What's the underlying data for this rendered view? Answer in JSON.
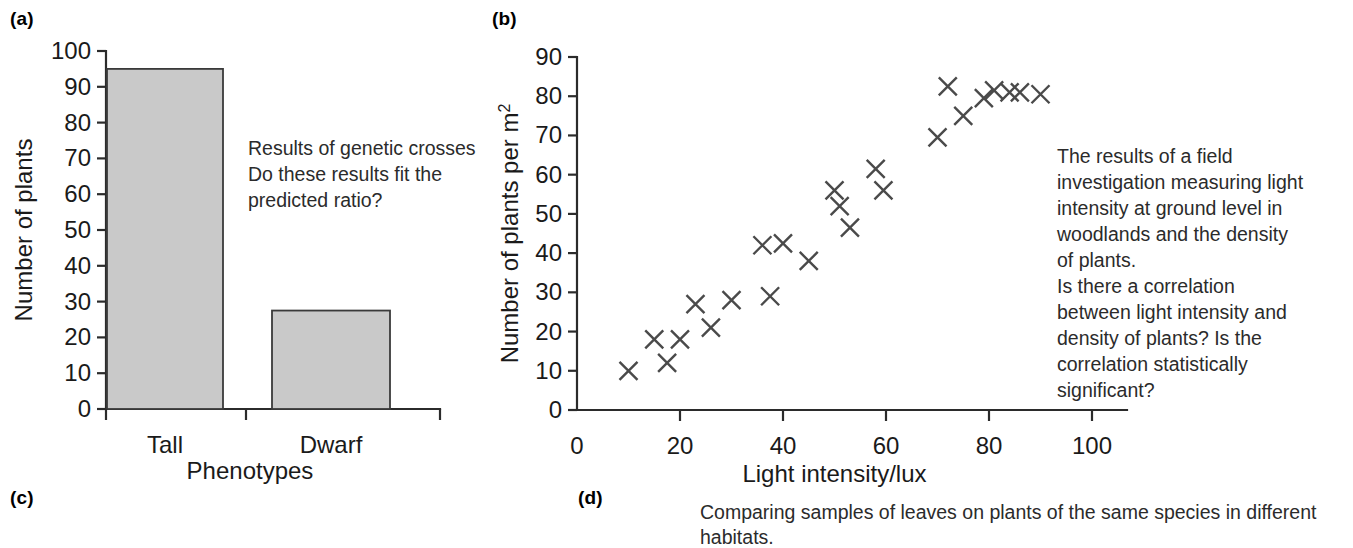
{
  "figure": {
    "panels": [
      {
        "key": "a",
        "label": "(a)"
      },
      {
        "key": "b",
        "label": "(b)"
      },
      {
        "key": "c",
        "label": "(c)"
      },
      {
        "key": "d",
        "label": "(d)"
      }
    ]
  },
  "panel_a": {
    "note": "Results of genetic crosses\nDo these results fit the\npredicted ratio?"
  },
  "panel_b": {
    "note": "The results of a field\ninvestigation measuring light\nintensity at ground level in\nwoodlands and the density\nof plants.\nIs there a correlation\nbetween light intensity and\ndensity of plants? Is the\ncorrelation statistically\nsignificant?"
  },
  "panel_d": {
    "caption": "Comparing samples of leaves on plants of the same species in different habitats."
  },
  "colors": {
    "bar_fill": "#c9c9c9",
    "bar_stroke": "#3a3a3a",
    "axis": "#2b2b2b",
    "marker": "#4a4a4a",
    "text": "#1a1a1a"
  },
  "chart_data": [
    {
      "id": "chart-a",
      "type": "bar",
      "title": "",
      "xlabel": "Phenotypes",
      "ylabel": "Number of plants",
      "categories": [
        "Tall",
        "Dwarf"
      ],
      "values": [
        95,
        27.5
      ],
      "ylim": [
        0,
        100
      ],
      "yticks": [
        0,
        10,
        20,
        30,
        40,
        50,
        60,
        70,
        80,
        90,
        100
      ],
      "ytick_labels": [
        "0",
        "10",
        "20",
        "30",
        "40",
        "50",
        "60",
        "70",
        "80",
        "90",
        "100"
      ],
      "grid": false,
      "legend": "none"
    },
    {
      "id": "chart-b",
      "type": "scatter",
      "title": "",
      "xlabel": "Light intensity/lux",
      "ylabel": "Number of plants per m2",
      "ylabel_display": "Number of plants per m",
      "ylabel_superscript": "2",
      "xlim": [
        0,
        100
      ],
      "ylim": [
        0,
        90
      ],
      "xticks": [
        0,
        20,
        40,
        60,
        80,
        100
      ],
      "xtick_labels": [
        "0",
        "20",
        "40",
        "60",
        "80",
        "100"
      ],
      "yticks": [
        0,
        10,
        20,
        30,
        40,
        50,
        60,
        70,
        80,
        90
      ],
      "ytick_labels": [
        "0",
        "10",
        "20",
        "30",
        "40",
        "50",
        "60",
        "70",
        "80",
        "90"
      ],
      "marker": "x",
      "grid": false,
      "legend": "none",
      "points": [
        {
          "x": 10,
          "y": 10
        },
        {
          "x": 15,
          "y": 18
        },
        {
          "x": 17.5,
          "y": 12
        },
        {
          "x": 20,
          "y": 18
        },
        {
          "x": 23,
          "y": 27
        },
        {
          "x": 26,
          "y": 21
        },
        {
          "x": 30,
          "y": 28
        },
        {
          "x": 36,
          "y": 42
        },
        {
          "x": 37.5,
          "y": 29
        },
        {
          "x": 40,
          "y": 42.5
        },
        {
          "x": 45,
          "y": 38
        },
        {
          "x": 50,
          "y": 56
        },
        {
          "x": 51,
          "y": 52
        },
        {
          "x": 53,
          "y": 46.5
        },
        {
          "x": 58,
          "y": 61.5
        },
        {
          "x": 59.5,
          "y": 56
        },
        {
          "x": 70,
          "y": 69.5
        },
        {
          "x": 72,
          "y": 82.5
        },
        {
          "x": 75,
          "y": 75
        },
        {
          "x": 79,
          "y": 79.5
        },
        {
          "x": 81,
          "y": 81.5
        },
        {
          "x": 84,
          "y": 81
        },
        {
          "x": 86,
          "y": 81
        },
        {
          "x": 90,
          "y": 80.5
        }
      ]
    }
  ]
}
